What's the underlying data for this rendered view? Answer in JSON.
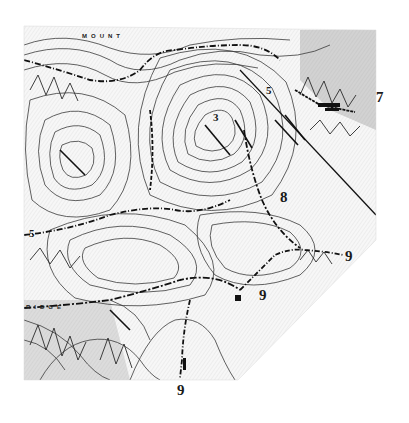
{
  "map": {
    "type": "topographic-map-scan",
    "style": "black-and-white contour lines",
    "colors": {
      "background": "#ffffff",
      "ink": "#1a1a1a",
      "contour": "#3a3a3a",
      "hatch": "#9a9a9a"
    },
    "place_labels": [
      {
        "id": "mountain",
        "text": "MOUNT",
        "x": 82,
        "y": 33
      },
      {
        "id": "ridge",
        "text": "RIDGE",
        "x": 26,
        "y": 304
      }
    ],
    "markers": [
      {
        "id": "marker-7",
        "text": "7",
        "x": 376,
        "y": 90
      },
      {
        "id": "marker-8",
        "text": "8",
        "x": 280,
        "y": 190
      },
      {
        "id": "marker-9-east",
        "text": "9",
        "x": 345,
        "y": 249
      },
      {
        "id": "marker-9-middle",
        "text": "9",
        "x": 259,
        "y": 288
      },
      {
        "id": "marker-9-south",
        "text": "9",
        "x": 177,
        "y": 383
      },
      {
        "id": "marker-5-north",
        "text": "5",
        "x": 266,
        "y": 85
      },
      {
        "id": "marker-3",
        "text": "3",
        "x": 213,
        "y": 112
      },
      {
        "id": "marker-5-west",
        "text": "5",
        "x": 29,
        "y": 228
      }
    ]
  }
}
